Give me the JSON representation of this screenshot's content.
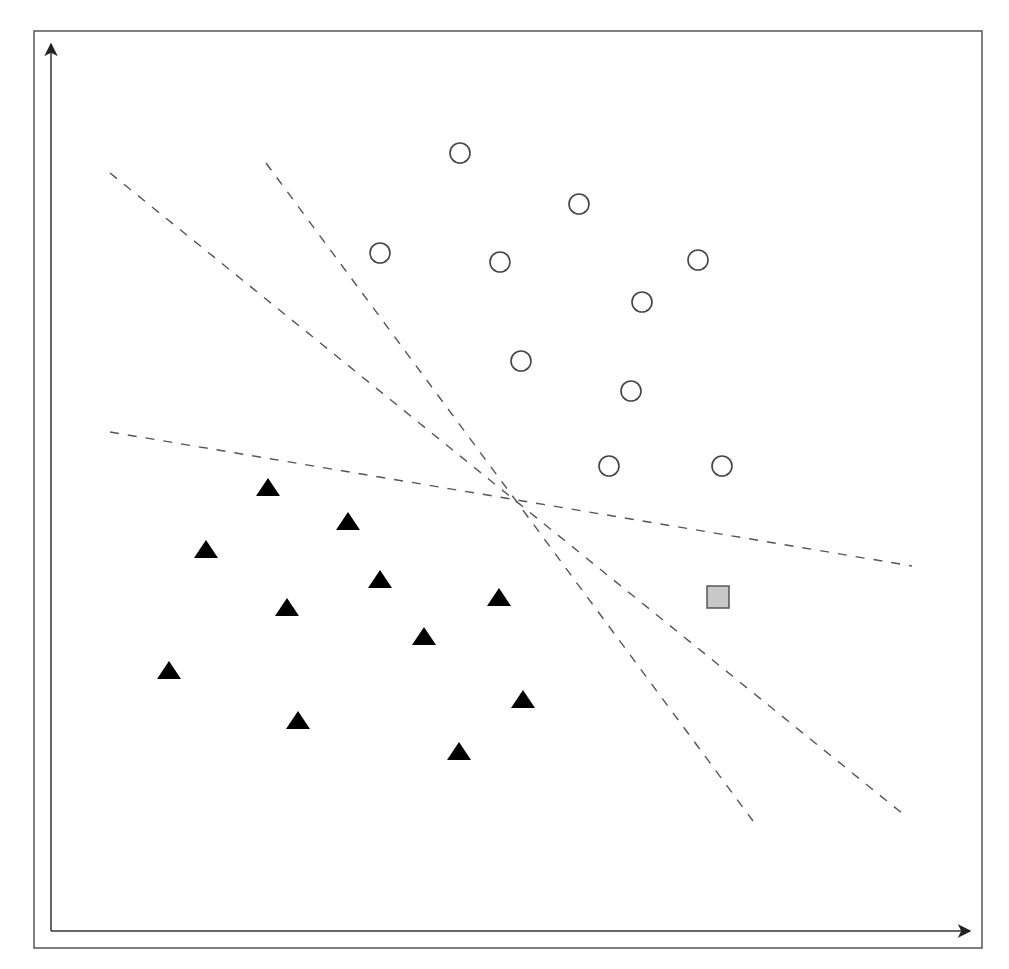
{
  "figure": {
    "frame": {
      "x1": 34,
      "y1": 31,
      "x2": 982,
      "y2": 948,
      "stroke": "#555555"
    },
    "axes": {
      "origin": [
        51,
        931
      ],
      "y_axis_tip": [
        51,
        44
      ],
      "x_axis_tip": [
        970,
        931
      ],
      "x_label": "",
      "y_label": "",
      "stroke": "#333333"
    },
    "colors": {
      "circle_stroke": "#444444",
      "circle_fill": "#ffffff",
      "triangle_fill": "#000000",
      "query_fill": "#c8c8c8",
      "query_stroke": "#555555",
      "line_stroke": "#555555"
    }
  },
  "chart_data": {
    "type": "scatter",
    "title": "",
    "xlabel": "",
    "ylabel": "",
    "grid": false,
    "legend": null,
    "coordinate_note": "pixel coordinates in image space (y grows downward)",
    "series": [
      {
        "name": "class-circles",
        "marker": "circle-open",
        "points": [
          [
            460,
            153
          ],
          [
            579,
            204
          ],
          [
            380,
            253
          ],
          [
            500,
            262
          ],
          [
            698,
            260
          ],
          [
            642,
            302
          ],
          [
            521,
            361
          ],
          [
            631,
            391
          ],
          [
            609,
            466
          ],
          [
            722,
            466
          ]
        ]
      },
      {
        "name": "class-triangles",
        "marker": "triangle-filled",
        "points": [
          [
            268,
            488
          ],
          [
            348,
            522
          ],
          [
            206,
            550
          ],
          [
            380,
            580
          ],
          [
            287,
            608
          ],
          [
            499,
            598
          ],
          [
            424,
            637
          ],
          [
            169,
            671
          ],
          [
            523,
            700
          ],
          [
            298,
            721
          ],
          [
            459,
            752
          ]
        ]
      },
      {
        "name": "query-point",
        "marker": "square-gray",
        "points": [
          [
            718,
            597
          ]
        ]
      }
    ],
    "lines": [
      {
        "name": "hyperplane-a",
        "style": "dashed",
        "from": [
          110,
          173
        ],
        "to": [
          903,
          814
        ]
      },
      {
        "name": "hyperplane-b",
        "style": "dashed",
        "from": [
          266,
          163
        ],
        "to": [
          753,
          821
        ]
      },
      {
        "name": "hyperplane-c",
        "style": "dashed",
        "from": [
          110,
          432
        ],
        "to": [
          912,
          566
        ]
      }
    ],
    "intersection": [
      510,
      495
    ]
  }
}
